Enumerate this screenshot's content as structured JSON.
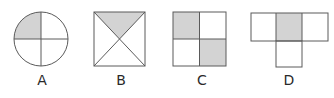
{
  "colors": {
    "stroke": "#5a5a5a",
    "shade": "#d3d3d3",
    "background": "#ffffff"
  },
  "figures": [
    {
      "id": "A",
      "label": "A",
      "shape": "circle divided into 4 quarters",
      "shaded": [
        "top-left quarter"
      ]
    },
    {
      "id": "B",
      "label": "B",
      "shape": "square divided by both diagonals into 4 triangles",
      "shaded": [
        "top triangle"
      ]
    },
    {
      "id": "C",
      "label": "C",
      "shape": "square divided into 2x2 grid",
      "shaded": [
        "top-left",
        "bottom-right"
      ]
    },
    {
      "id": "D",
      "label": "D",
      "shape": "T-shape of 4 squares (3 in a row, 1 below middle)",
      "shaded": [
        "top-middle"
      ]
    }
  ]
}
